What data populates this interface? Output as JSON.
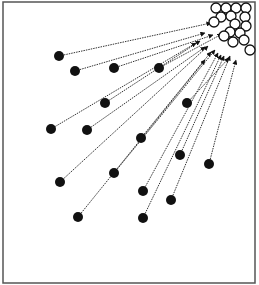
{
  "diagram": {
    "frame": {
      "x": 3,
      "y": 2,
      "width": 252,
      "height": 281,
      "stroke": "#555555"
    },
    "colors": {
      "dot": "#111111",
      "circle_stroke": "#111111",
      "circle_fill": "#ffffff",
      "arrow": "#333333"
    },
    "target_circles": [
      {
        "cx": 216,
        "cy": 8,
        "r": 5
      },
      {
        "cx": 226,
        "cy": 8,
        "r": 5
      },
      {
        "cx": 236,
        "cy": 8,
        "r": 5
      },
      {
        "cx": 246,
        "cy": 8,
        "r": 5
      },
      {
        "cx": 221,
        "cy": 17,
        "r": 5
      },
      {
        "cx": 231,
        "cy": 16,
        "r": 5
      },
      {
        "cx": 245,
        "cy": 17,
        "r": 5
      },
      {
        "cx": 214,
        "cy": 22,
        "r": 5
      },
      {
        "cx": 235,
        "cy": 24,
        "r": 5
      },
      {
        "cx": 246,
        "cy": 26,
        "r": 5
      },
      {
        "cx": 230,
        "cy": 32,
        "r": 5
      },
      {
        "cx": 240,
        "cy": 33,
        "r": 5
      },
      {
        "cx": 224,
        "cy": 36,
        "r": 5
      },
      {
        "cx": 233,
        "cy": 42,
        "r": 5
      },
      {
        "cx": 244,
        "cy": 40,
        "r": 5
      },
      {
        "cx": 250,
        "cy": 50,
        "r": 5
      }
    ],
    "agents": [
      {
        "x": 59,
        "y": 56,
        "tx": 211,
        "ty": 23
      },
      {
        "x": 75,
        "y": 71,
        "tx": 205,
        "ty": 33
      },
      {
        "x": 114,
        "y": 68,
        "tx": 213,
        "ty": 35
      },
      {
        "x": 159,
        "y": 68,
        "tx": 222,
        "ty": 34
      },
      {
        "x": 105,
        "y": 103,
        "tx": 200,
        "ty": 41
      },
      {
        "x": 51,
        "y": 129,
        "tx": 196,
        "ty": 43
      },
      {
        "x": 87,
        "y": 130,
        "tx": 205,
        "ty": 47
      },
      {
        "x": 187,
        "y": 103,
        "tx": 229,
        "ty": 58
      },
      {
        "x": 141,
        "y": 138,
        "tx": 211,
        "ty": 52
      },
      {
        "x": 180,
        "y": 155,
        "tx": 224,
        "ty": 56
      },
      {
        "x": 209,
        "y": 164,
        "tx": 236,
        "ty": 60
      },
      {
        "x": 60,
        "y": 182,
        "tx": 208,
        "ty": 46
      },
      {
        "x": 114,
        "y": 173,
        "tx": 215,
        "ty": 50
      },
      {
        "x": 143,
        "y": 191,
        "tx": 218,
        "ty": 53
      },
      {
        "x": 171,
        "y": 200,
        "tx": 230,
        "ty": 56
      },
      {
        "x": 78,
        "y": 217,
        "tx": 205,
        "ty": 60
      },
      {
        "x": 143,
        "y": 218,
        "tx": 221,
        "ty": 55
      }
    ]
  }
}
